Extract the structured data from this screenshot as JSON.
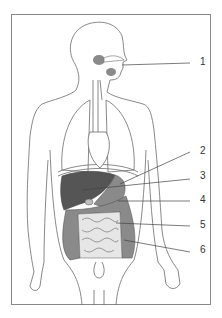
{
  "diagram": {
    "type": "anatomical-diagram",
    "labels": [
      {
        "number": "1",
        "x": 200,
        "y": 61
      },
      {
        "number": "2",
        "x": 200,
        "y": 150
      },
      {
        "number": "3",
        "x": 200,
        "y": 175
      },
      {
        "number": "4",
        "x": 200,
        "y": 197
      },
      {
        "number": "5",
        "x": 200,
        "y": 223
      },
      {
        "number": "6",
        "x": 200,
        "y": 248
      }
    ]
  },
  "colors": {
    "outline": "#6b6b6b",
    "organ_dark": "#555555",
    "organ_mid": "#8a8a8a",
    "organ_light": "#bdbdbd",
    "intestine_light": "#e6e6e6",
    "frame": "#888888",
    "leader": "#444444"
  }
}
